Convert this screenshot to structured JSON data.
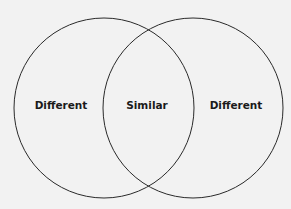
{
  "diagram": {
    "type": "venn",
    "sets": [
      {
        "name": "left-circle",
        "label": "Different"
      },
      {
        "name": "right-circle",
        "label": "Different"
      }
    ],
    "intersection_label": "Similar"
  },
  "colors": {
    "background": "#f2f2f2",
    "stroke": "#2a2a2a",
    "text": "#1a1a1a"
  }
}
